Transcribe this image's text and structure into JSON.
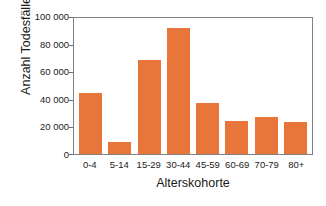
{
  "chart_data": {
    "type": "bar",
    "title": "",
    "xlabel": "Alterskohorte",
    "ylabel": "Anzahl Todesfälle",
    "categories": [
      "0-4",
      "5-14",
      "15-29",
      "30-44",
      "45-59",
      "60-69",
      "70-79",
      "80+"
    ],
    "values": [
      44000,
      9000,
      68000,
      91000,
      37000,
      24000,
      27000,
      23000
    ],
    "ylim": [
      0,
      100000
    ],
    "ytick_values": [
      0,
      20000,
      40000,
      60000,
      80000,
      100000
    ],
    "ytick_labels": [
      "0",
      "20 000",
      "40 000",
      "60 000",
      "80 000",
      "100 000"
    ],
    "grid": false,
    "legend": false,
    "legend_position": "none",
    "bar_color": "#E8763A",
    "axis_color": "#808080",
    "background_color": "#FFFFFF"
  }
}
